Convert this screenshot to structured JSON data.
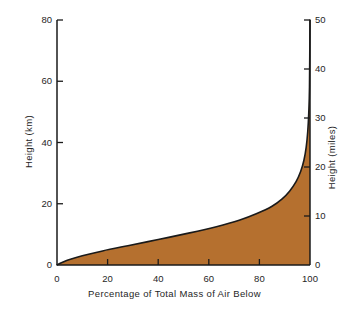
{
  "chart_data": {
    "type": "area",
    "title": "",
    "xlabel": "Percentage of Total Mass of Air Below",
    "ylabel": "Height (km)",
    "ylabel_right": "Height (miles)",
    "xlim": [
      0,
      100
    ],
    "ylim": [
      0,
      80
    ],
    "ylim_right": [
      0,
      50
    ],
    "grid": false,
    "legend": null,
    "xticks": [
      0,
      20,
      40,
      60,
      80,
      100
    ],
    "xtick_labels": [
      "0",
      "20",
      "40",
      "60",
      "80",
      "100"
    ],
    "yticks": [
      0,
      20,
      40,
      60,
      80
    ],
    "ytick_labels": [
      "0",
      "20",
      "40",
      "60",
      "80"
    ],
    "yticks_right": [
      0,
      10,
      20,
      30,
      40,
      50
    ],
    "ytick_labels_right": [
      "0",
      "10",
      "20",
      "30",
      "40",
      "50"
    ],
    "fill_color": "#b5702f",
    "line_color": "#1a1a1a",
    "series": [
      {
        "name": "Cumulative mass of air below height",
        "x": [
          0,
          2,
          5,
          10,
          18,
          28,
          40,
          52,
          63,
          72,
          79,
          85,
          89,
          92,
          94.5,
          96.3,
          97.6,
          98.5,
          99.1,
          99.5,
          99.8,
          100
        ],
        "y": [
          0,
          0.8,
          1.8,
          3.0,
          4.6,
          6.3,
          8.3,
          10.4,
          12.5,
          14.6,
          16.8,
          19.2,
          21.6,
          24.2,
          27.2,
          30.5,
          34.2,
          38.5,
          43.5,
          49.5,
          58.0,
          80
        ],
        "x_units": "percent",
        "y_units": "km"
      }
    ]
  }
}
